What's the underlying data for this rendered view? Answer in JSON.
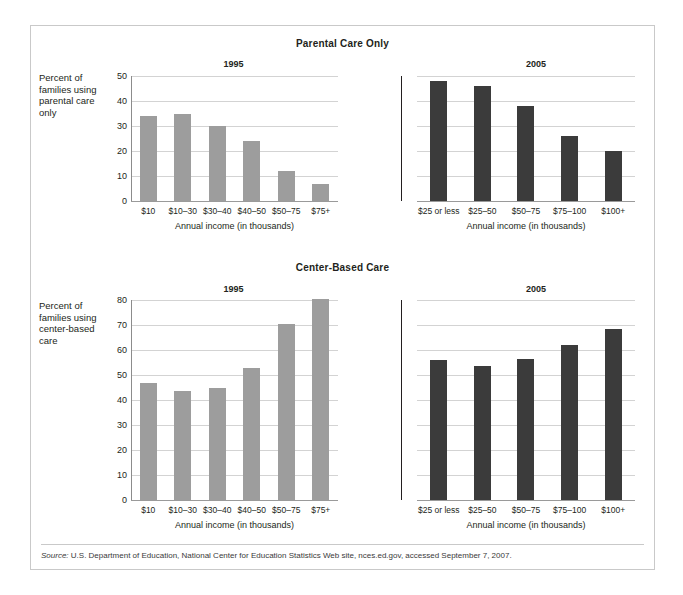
{
  "figure": {
    "source_prefix": "Source:",
    "source_text": " U.S. Department of Education, National Center for Education Statistics Web site, nces.ed.gov, accessed September 7, 2007."
  },
  "colors": {
    "bar_1995": "#9d9d9d",
    "bar_2005": "#3b3b3b",
    "gridline": "#d3d3d3",
    "divider": "#231f20",
    "frame": "#c9c9c9"
  },
  "chart_data": [
    {
      "type": "bar",
      "title": "Parental Care Only",
      "ylabel": "Percent of families using parental care only",
      "xlabel": "Annual income (in thousands)",
      "ylim": [
        0,
        50
      ],
      "yticks": [
        0,
        10,
        20,
        30,
        40,
        50
      ],
      "grid": true,
      "legend": "none",
      "panels": [
        {
          "name": "1995",
          "categories": [
            "$10",
            "$10–30",
            "$30–40",
            "$40–50",
            "$50–75",
            "$75+"
          ],
          "values": [
            34,
            35,
            30,
            24,
            12,
            7
          ],
          "xlabel": "Annual income (in thousands)",
          "color": "#9d9d9d"
        },
        {
          "name": "2005",
          "categories": [
            "$25 or less",
            "$25–50",
            "$50–75",
            "$75–100",
            "$100+"
          ],
          "values": [
            48,
            46,
            38,
            26,
            20
          ],
          "xlabel": "Annual income (in thousands)",
          "color": "#3b3b3b"
        }
      ]
    },
    {
      "type": "bar",
      "title": "Center-Based Care",
      "ylabel": "Percent of families using center-based care",
      "xlabel": "Annual income (in thousands)",
      "ylim": [
        0,
        80
      ],
      "yticks": [
        0,
        10,
        20,
        30,
        40,
        50,
        60,
        70,
        80
      ],
      "grid": true,
      "legend": "none",
      "panels": [
        {
          "name": "1995",
          "categories": [
            "$10",
            "$10–30",
            "$30–40",
            "$40–50",
            "$50–75",
            "$75+"
          ],
          "values": [
            47,
            43.5,
            45,
            53,
            70.5,
            80.5
          ],
          "xlabel": "Annual income (in thousands)",
          "color": "#9d9d9d"
        },
        {
          "name": "2005",
          "categories": [
            "$25 or less",
            "$25–50",
            "$50–75",
            "$75–100",
            "$100+"
          ],
          "values": [
            56,
            53.5,
            56.5,
            62,
            68.5
          ],
          "xlabel": "Annual income (in thousands)",
          "color": "#3b3b3b"
        }
      ]
    }
  ]
}
